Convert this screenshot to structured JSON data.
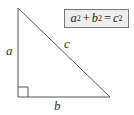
{
  "diagram": {
    "labels": {
      "a": "a",
      "b": "b",
      "c": "c"
    },
    "formula": {
      "term1": "a",
      "exp1": "2",
      "plus": "+",
      "term2": "b",
      "exp2": "2",
      "equals": "=",
      "term3": "c",
      "exp3": "2",
      "text": "a^2 + b^2 = c^2"
    },
    "vertices": {
      "top": [
        18,
        8
      ],
      "bottom_left": [
        18,
        97
      ],
      "bottom_right": [
        110,
        97
      ]
    },
    "right_angle_marker_size": 10,
    "colors": {
      "stroke": "#555555",
      "box_fill": "#eeeeee",
      "box_border": "#777777",
      "text": "#333333"
    }
  }
}
